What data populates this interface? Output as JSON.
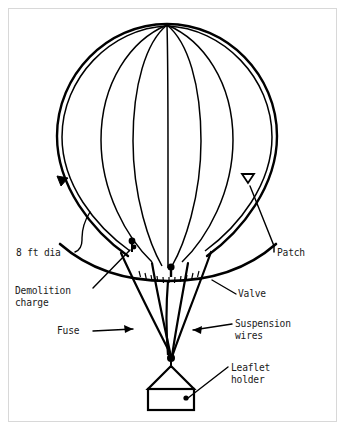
{
  "figure": {
    "kind": "technical-line-drawing",
    "background_color": "#ffffff",
    "ink_color": "#000000",
    "frame_color": "#d8d8d8"
  },
  "labels": {
    "diameter": "8 ft dia",
    "demolition_charge_line1": "Demolition",
    "demolition_charge_line2": "charge",
    "fuse": "Fuse",
    "patch": "Patch",
    "valve": "Valve",
    "suspension_wires_line1": "Suspension",
    "suspension_wires_line2": "wires",
    "leaflet_holder_line1": "Leaflet",
    "leaflet_holder_line2": "holder"
  },
  "parts": [
    {
      "id": "envelope",
      "name": "balloon envelope"
    },
    {
      "id": "gores",
      "name": "gore seam lines"
    },
    {
      "id": "hem",
      "name": "lower hem band"
    },
    {
      "id": "patch",
      "name": "patch marker"
    },
    {
      "id": "demolition-charge",
      "name": "demolition charge"
    },
    {
      "id": "valve",
      "name": "valve"
    },
    {
      "id": "fuse",
      "name": "fuse line"
    },
    {
      "id": "suspension-wires",
      "name": "suspension wires"
    },
    {
      "id": "knot",
      "name": "suspension knot"
    },
    {
      "id": "leaflet-holder",
      "name": "leaflet holder box"
    }
  ]
}
